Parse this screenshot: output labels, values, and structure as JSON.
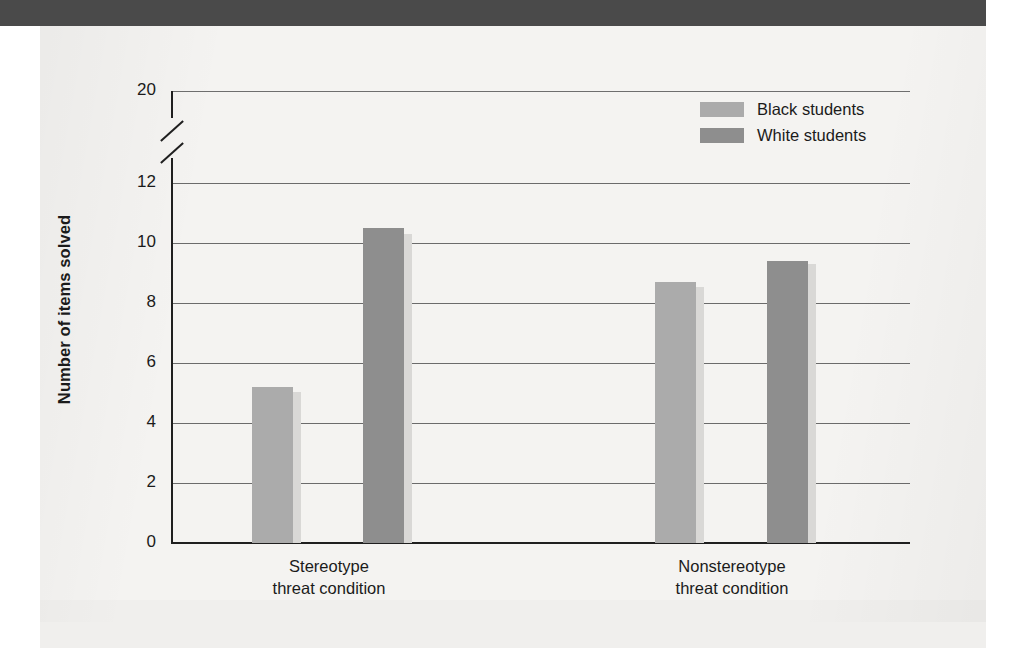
{
  "figure": {
    "background_color": "#f4f3f1",
    "top_band_color": "#4a4a4a"
  },
  "chart_data": {
    "type": "bar",
    "title": "",
    "xlabel": "",
    "ylabel": "Number of items solved",
    "categories": [
      "Stereotype\nthreat condition",
      "Nonstereotype\nthreat condition"
    ],
    "category_lines": [
      [
        "Stereotype",
        "threat condition"
      ],
      [
        "Nonstereotype",
        "threat condition"
      ]
    ],
    "series": [
      {
        "name": "Black students",
        "color": "#ababab",
        "values": [
          5.2,
          8.7
        ]
      },
      {
        "name": "White students",
        "color": "#8e8e8e",
        "values": [
          10.5,
          9.4
        ]
      }
    ],
    "ylim": [
      0,
      20
    ],
    "yticks": [
      0,
      2,
      4,
      6,
      8,
      10,
      12,
      20
    ],
    "ytick_labels": [
      "0",
      "2",
      "4",
      "6",
      "8",
      "10",
      "12",
      "20"
    ],
    "axis_break": {
      "present": true,
      "between": [
        12,
        20
      ]
    },
    "grid": true,
    "grid_axis": "y",
    "legend_position": "upper right",
    "legend_entries": [
      "Black students",
      "White students"
    ]
  }
}
